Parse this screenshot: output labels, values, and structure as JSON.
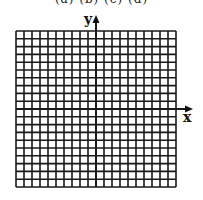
{
  "top_text_fragment": "(a) (b) (c) (d)",
  "grid": {
    "columns": 20,
    "rows": 20,
    "line_color": "#1a1a1a"
  },
  "axes": {
    "x_label": "x",
    "y_label": "y"
  }
}
